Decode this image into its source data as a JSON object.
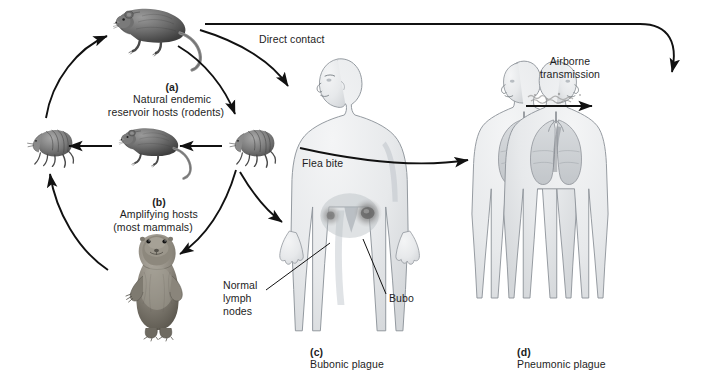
{
  "figure": {
    "width": 717,
    "height": 360
  },
  "labels": {
    "panel_a": "(a) Natural endemic\n      reservoir hosts (rodents)",
    "panel_a_tag": "(a)",
    "panel_a_text": "Natural endemic\nreservoir hosts (rodents)",
    "panel_b_tag": "(b)",
    "panel_b_text": "Amplifying hosts\n(most mammals)",
    "panel_c_tag": "(c)",
    "panel_c_text": "Bubonic plague",
    "panel_d_tag": "(d)",
    "panel_d_text": "Pneumonic plague",
    "direct_contact": "Direct contact",
    "flea_bite": "Flea bite",
    "airborne": "Airborne\ntransmission",
    "normal_lymph_nodes": "Normal\nlymph\nnodes",
    "bubo": "Bubo"
  },
  "organisms": {
    "rat_top": "rat-illustration",
    "rat_middle": "rat-illustration",
    "flea_left": "flea-illustration",
    "flea_right": "flea-illustration",
    "prairie_dog": "prairie-dog-illustration",
    "human_bubonic": "human-figure-bubonic",
    "human_pneumonic_left": "human-figure-pneumonic",
    "human_pneumonic_right": "human-figure-pneumonic"
  },
  "colors": {
    "ink": "#1a1a1a",
    "body_fill": "#e9eaec",
    "body_stroke": "#9aa0a6",
    "lung_fill": "#d3d6d9",
    "animal_dark": "#4a4a4a",
    "animal_mid": "#7d7d7d",
    "animal_light": "#b5b5b5",
    "bubo": "#6e6e6e"
  }
}
